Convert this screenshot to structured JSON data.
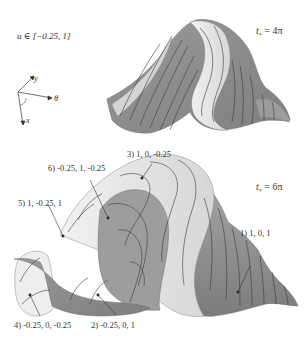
{
  "figure": {
    "range_label": "u ∈ [−0.25, 1]",
    "axes": {
      "y": "y",
      "theta": "θ",
      "x": "x"
    },
    "panels": [
      {
        "id": "top",
        "time_label": "t* = 4π",
        "time_var": "t",
        "time_sub": "*",
        "time_value": "= 4π"
      },
      {
        "id": "bottom",
        "time_label": "t* = 6π",
        "time_var": "t",
        "time_sub": "*",
        "time_value": "= 6π"
      }
    ],
    "annotations": [
      {
        "index": 1,
        "text": "1) 1, 0, 1"
      },
      {
        "index": 2,
        "text": "2) -0.25, 0, 1"
      },
      {
        "index": 3,
        "text": "3) 1, 0, -0.25"
      },
      {
        "index": 4,
        "text": "4) -0.25, 0, -0.25"
      },
      {
        "index": 5,
        "text": "5) 1, -0.25, 1"
      },
      {
        "index": 6,
        "text": "6) -0.25, 1, -0.25"
      }
    ],
    "colors": {
      "surface_dark": "#8a8a8a",
      "surface_mid": "#a6a6a6",
      "surface_light": "#e6e6e6",
      "contour": "#3a3a3a"
    }
  }
}
